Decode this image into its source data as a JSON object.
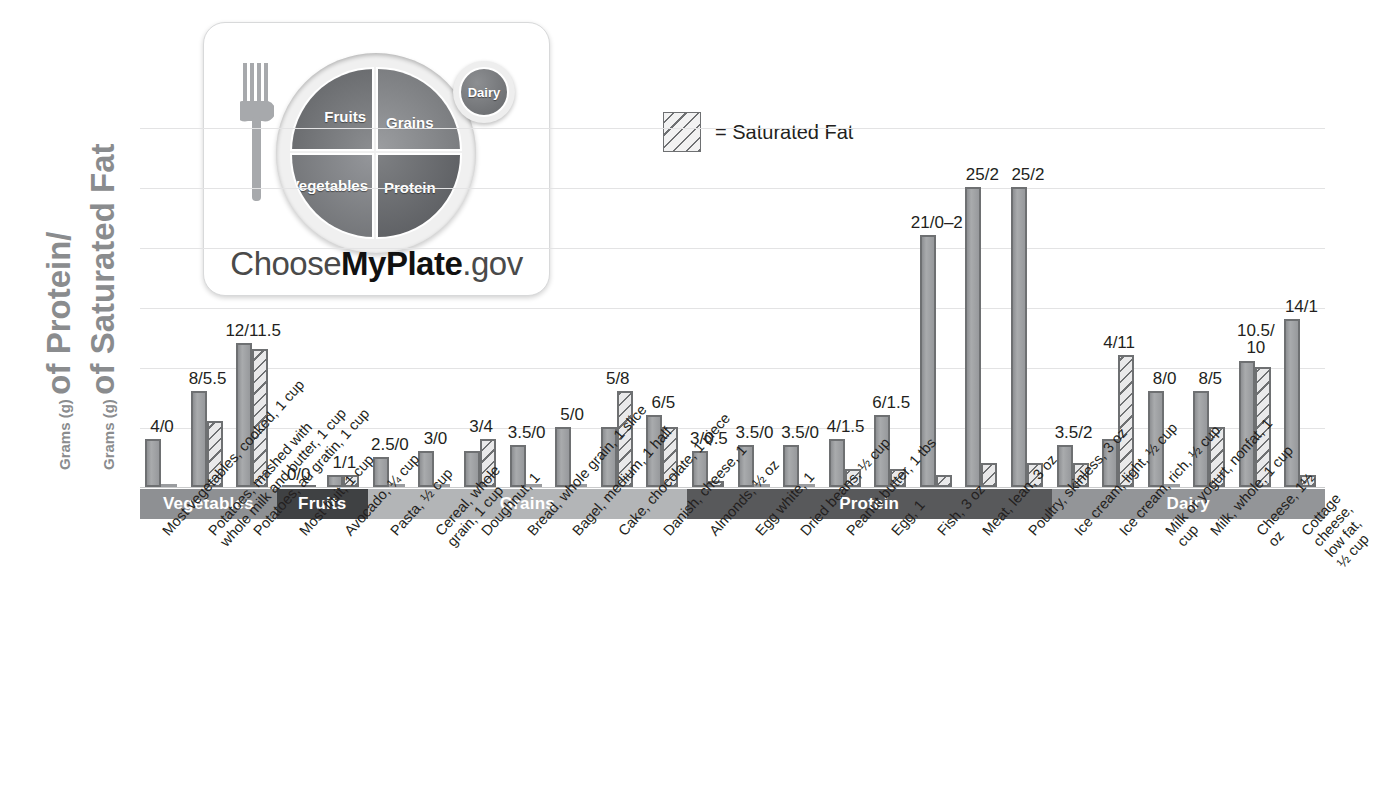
{
  "axis": {
    "title_line1_small": "Grams (g)",
    "title_line1_big": "of Protein/",
    "title_line2_small": "Grams (g)",
    "title_line2_big": "of Saturated Fat"
  },
  "legend": {
    "swatch_name": "saturated-fat-hatch-swatch",
    "text": "= Saturated Fat"
  },
  "logo": {
    "fruits": "Fruits",
    "grains": "Grains",
    "vegetables": "Vegetables",
    "protein": "Protein",
    "dairy": "Dairy",
    "wordmark_pre": "Choose",
    "wordmark_bold": "MyPlate",
    "wordmark_post": ".gov"
  },
  "colors": {
    "bar_protein": "#9a9c9f",
    "bar_outline": "#6e7072",
    "band_vegetables": "#8e9093",
    "band_fruits": "#3f4143",
    "band_grains": "#b3b5b7",
    "band_protein": "#58595b",
    "band_dairy": "#939598",
    "gridline": "#e3e3e4",
    "axis_title": "#8a8c8e"
  },
  "chart_data": {
    "type": "bar",
    "title": "",
    "xlabel": "",
    "ylabel": "Grams (g) of Protein/Grams (g) of Saturated Fat",
    "ylim": [
      0,
      30
    ],
    "ygrid_values": [
      5,
      10,
      15,
      20,
      25,
      30
    ],
    "grid": true,
    "legend_position": "top-center",
    "series": [
      {
        "name": "Protein (g)",
        "style": "solid-gray"
      },
      {
        "name": "Saturated Fat (g)",
        "style": "diagonal-hatch"
      }
    ],
    "groups": [
      {
        "band": "Vegetables",
        "label": "Most vegetables, cooked, 1 cup",
        "protein": 4,
        "fat": 0,
        "value_label": "4/0"
      },
      {
        "band": "Vegetables",
        "label": "Potatoes, mashed with\nwhole milk and butter, 1 cup",
        "protein": 8,
        "fat": 5.5,
        "value_label": "8/5.5"
      },
      {
        "band": "Vegetables",
        "label": "Potatoes, au gratin, 1 cup",
        "protein": 12,
        "fat": 11.5,
        "value_label": "12/11.5"
      },
      {
        "band": "Fruits",
        "label": "Most fruit, 1 cup",
        "protein": 0,
        "fat": 0,
        "value_label": "0/0"
      },
      {
        "band": "Fruits",
        "label": "Avocado, ¼ cup",
        "protein": 1,
        "fat": 1,
        "value_label": "1/1"
      },
      {
        "band": "Grains",
        "label": "Pasta, ½ cup",
        "protein": 2.5,
        "fat": 0,
        "value_label": "2.5/0"
      },
      {
        "band": "Grains",
        "label": "Cereal, whole\ngrain, 1 cup",
        "protein": 3,
        "fat": 0,
        "value_label": "3/0"
      },
      {
        "band": "Grains",
        "label": "Doughnut, 1",
        "protein": 3,
        "fat": 4,
        "value_label": "3/4"
      },
      {
        "band": "Grains",
        "label": "Bread, whole grain, 1 slice",
        "protein": 3.5,
        "fat": 0,
        "value_label": "3.5/0"
      },
      {
        "band": "Grains",
        "label": "Bagel, medium, 1 half",
        "protein": 5,
        "fat": 0,
        "value_label": "5/0"
      },
      {
        "band": "Grains",
        "label": "Cake, chocolate, 1 piece",
        "protein": 5,
        "fat": 8,
        "value_label": "5/8"
      },
      {
        "band": "Grains",
        "label": "Danish, cheese, 1",
        "protein": 6,
        "fat": 5,
        "value_label": "6/5"
      },
      {
        "band": "Protein",
        "label": "Almonds, ½ oz",
        "protein": 3,
        "fat": 0.5,
        "value_label": "3/0.5"
      },
      {
        "band": "Protein",
        "label": "Egg white, 1",
        "protein": 3.5,
        "fat": 0,
        "value_label": "3.5/0"
      },
      {
        "band": "Protein",
        "label": "Dried beans, ½ cup",
        "protein": 3.5,
        "fat": 0,
        "value_label": "3.5/0"
      },
      {
        "band": "Protein",
        "label": "Peanut butter, 1 tbs",
        "protein": 4,
        "fat": 1.5,
        "value_label": "4/1.5"
      },
      {
        "band": "Protein",
        "label": "Egg, 1",
        "protein": 6,
        "fat": 1.5,
        "value_label": "6/1.5"
      },
      {
        "band": "Protein",
        "label": "Fish, 3 oz",
        "protein": 21,
        "fat": 1,
        "value_label": "21/0–2"
      },
      {
        "band": "Protein",
        "label": "Meat, lean, 3 oz",
        "protein": 25,
        "fat": 2,
        "value_label": "25/2"
      },
      {
        "band": "Protein",
        "label": "Poultry, skinless, 3 oz",
        "protein": 25,
        "fat": 2,
        "value_label": "25/2"
      },
      {
        "band": "Dairy",
        "label": "Ice cream, light, ½ cup",
        "protein": 3.5,
        "fat": 2,
        "value_label": "3.5/2"
      },
      {
        "band": "Dairy",
        "label": "Ice cream, rich, ½ cup",
        "protein": 4,
        "fat": 11,
        "value_label": "4/11"
      },
      {
        "band": "Dairy",
        "label": "Milk or yogurt, nonfat, 1 cup",
        "protein": 8,
        "fat": 0,
        "value_label": "8/0"
      },
      {
        "band": "Dairy",
        "label": "Milk, whole, 1 cup",
        "protein": 8,
        "fat": 5,
        "value_label": "8/5"
      },
      {
        "band": "Dairy",
        "label": "Cheese, 1½ oz",
        "protein": 10.5,
        "fat": 10,
        "value_label": "10.5/\n10"
      },
      {
        "band": "Dairy",
        "label": "Cottage cheese, low fat, ½ cup",
        "protein": 14,
        "fat": 1,
        "value_label": "14/1"
      }
    ],
    "bands": [
      {
        "label": "Vegetables",
        "from": 0,
        "to": 2
      },
      {
        "label": "Fruits",
        "from": 3,
        "to": 4
      },
      {
        "label": "Grains",
        "from": 5,
        "to": 11
      },
      {
        "label": "Protein",
        "from": 12,
        "to": 19
      },
      {
        "label": "Dairy",
        "from": 20,
        "to": 25
      }
    ]
  }
}
